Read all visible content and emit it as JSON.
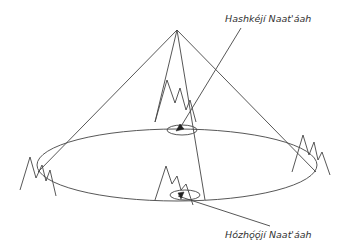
{
  "diagram": {
    "labels": {
      "upper": "Hashkéjí Naat'áah",
      "lower": "Hózhǫ́ǫ́jí Naat'áah"
    },
    "colors": {
      "stroke": "#444444",
      "background": "#ffffff",
      "text": "#333333"
    }
  }
}
